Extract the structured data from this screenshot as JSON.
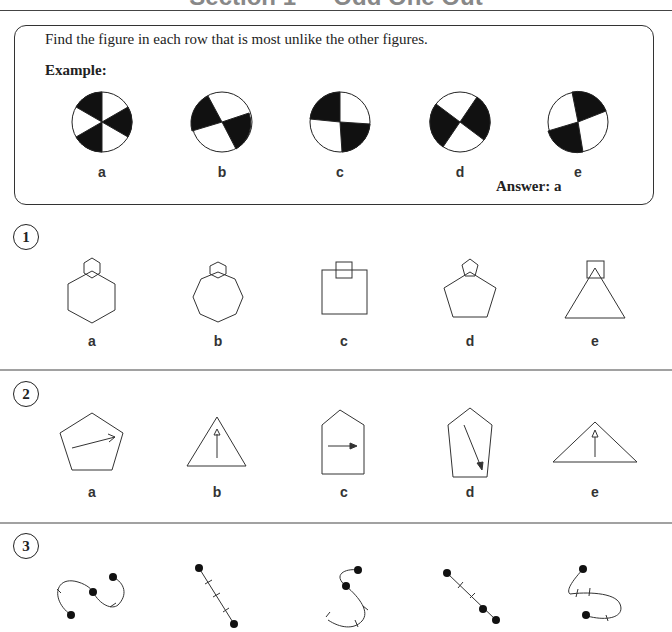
{
  "page": {
    "title": "Section 1 — Odd One Out"
  },
  "example": {
    "instruction": "Find the figure in each row that is most unlike the other figures.",
    "label": "Example:",
    "answer": "Answer: a",
    "options": [
      "a",
      "b",
      "c",
      "d",
      "e"
    ]
  },
  "questions": [
    {
      "number": "1",
      "options": [
        "a",
        "b",
        "c",
        "d",
        "e"
      ],
      "figures": [
        "hexagon with small hexagon on top",
        "heptagon with small hexagon on top",
        "square with small square on top",
        "pentagon with small pentagon on top",
        "triangle with small square on top"
      ]
    },
    {
      "number": "2",
      "options": [
        "a",
        "b",
        "c",
        "d",
        "e"
      ],
      "figures": [
        "pentagon with arrow pointing right",
        "triangle with open-head arrow pointing up",
        "house pentagon with arrow pointing right",
        "pentagon with arrow pointing down-right",
        "wide triangle with open-head arrow pointing up"
      ]
    },
    {
      "number": "3",
      "options": [
        "a",
        "b",
        "c",
        "d",
        "e"
      ],
      "figures": [
        "S-curve with three dots and two ticks",
        "straight line with two dots and three ticks",
        "S-curve with two dots and three ticks",
        "straight line with three dots and two ticks",
        "curve with two dots and three ticks"
      ]
    }
  ]
}
